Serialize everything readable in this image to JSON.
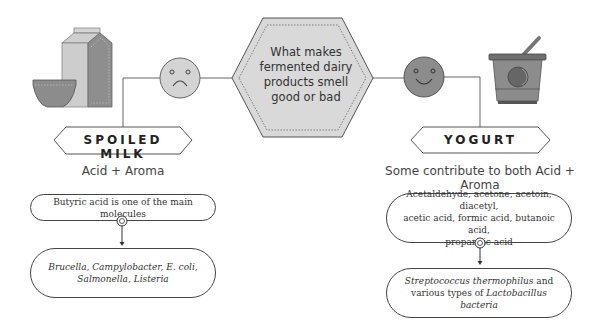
{
  "center": {
    "question": "What makes fermented dairy products smell good or bad"
  },
  "left": {
    "title": "SPOILED MILK",
    "subtitle": "Acid + Aroma",
    "face": "sad-face-icon",
    "illustration": "milk-carton-and-bowl",
    "molecules_box": "Butyric acid is one of the main molecules",
    "bacteria_box": {
      "line1": "Brucella, Campylobacter,  E. coli,",
      "line2": "Salmonella, Listeria"
    }
  },
  "right": {
    "title": "YOGURT",
    "subtitle": "Some contribute to both Acid + Aroma",
    "face": "happy-face-icon",
    "illustration": "yogurt-cup-with-spoon",
    "molecules_box": {
      "line1": "Acetaldehyde, acetone, acetoin, diacetyl,",
      "line2": "acetic acid, formic acid, butanoic acid,",
      "line3": "propanoic acid"
    },
    "bacteria_box": {
      "italic1": "Streptococcus thermophilus",
      "plain1": " and",
      "plain2": "various types of ",
      "italic2": "Lactobacillus bacteria"
    }
  },
  "colors": {
    "sad_face": "#d4d4d4",
    "happy_face": "#8c8c8c",
    "hexagon": "#d9d9d9",
    "line": "#555555"
  }
}
